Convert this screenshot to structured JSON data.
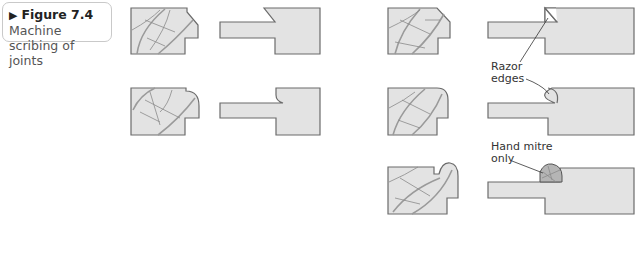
{
  "caption": {
    "marker": "▶",
    "figure_number": "Figure 7.4",
    "title_line1": "Machine",
    "title_line2": "scribing of joints"
  },
  "annotations": {
    "razor_line1": "Razor",
    "razor_line2": "edges",
    "mitre_line1": "Hand mitre",
    "mitre_line2": "only"
  },
  "colors": {
    "fill": "#e3e3e3",
    "stroke": "#6b6b6b",
    "grain": "#9a9a9a",
    "mitre_fill": "#b5b5b5"
  },
  "rows": [
    {
      "id": 1,
      "left_pair": "chamfer-stile-with-rail",
      "right_pair": "chamfer-stile-with-scribed-rail"
    },
    {
      "id": 2,
      "left_pair": "ovolo-stile-with-rail",
      "right_pair": "ovolo-stile-with-scribed-rail"
    },
    {
      "id": 3,
      "right_pair": "bead-stile-with-mitred-rail"
    }
  ]
}
